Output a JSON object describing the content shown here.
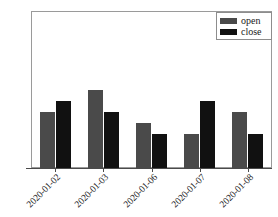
{
  "chart_data": {
    "type": "bar",
    "title": "",
    "subtitle": "",
    "xlabel": "",
    "ylabel": "",
    "categories": [
      "2020-01-02",
      "2020-01-03",
      "2020-01-06",
      "2020-01-07",
      "2020-01-08"
    ],
    "series": [
      {
        "name": "open",
        "color": "#4a4a4a",
        "values": [
          3.71,
          3.73,
          3.7,
          3.69,
          3.71
        ]
      },
      {
        "name": "close",
        "color": "#111111",
        "values": [
          3.72,
          3.71,
          3.69,
          3.72,
          3.69
        ]
      }
    ],
    "ylim": [
      3.66,
      3.8
    ],
    "yticks": [
      "3.66",
      "3.68",
      "3.70",
      "3.72",
      "3.74",
      "3.76",
      "3.78",
      "3.80"
    ],
    "ytick_values": [
      3.66,
      3.68,
      3.7,
      3.72,
      3.74,
      3.76,
      3.78,
      3.8
    ],
    "grid": false,
    "legend_position": "upper right",
    "xtick_rotation": -45
  },
  "legend": {
    "items": [
      {
        "label": "open",
        "color": "#4a4a4a"
      },
      {
        "label": "close",
        "color": "#111111"
      }
    ]
  },
  "axes": {
    "y_tick_labels": [
      "3.80",
      "3.78",
      "3.76",
      "3.74",
      "3.72",
      "3.70",
      "3.68",
      "3.66"
    ],
    "x_tick_labels": [
      "2020-01-02",
      "2020-01-03",
      "2020-01-06",
      "2020-01-07",
      "2020-01-08"
    ]
  },
  "colors": {
    "open_bar": "#4a4a4a",
    "close_bar": "#111111",
    "frame": "#9a9a9a",
    "axis": "#4a4a4a",
    "background": "#ffffff"
  },
  "footer": {
    "clipped_text": ""
  }
}
